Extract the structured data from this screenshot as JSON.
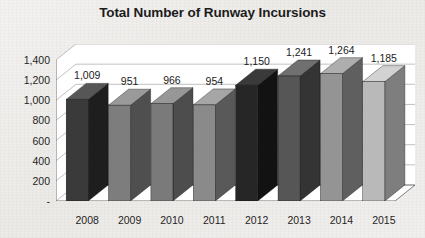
{
  "chart_data": {
    "type": "bar",
    "title": "Total Number of Runway Incursions",
    "xlabel": "",
    "ylabel": "",
    "categories": [
      "2008",
      "2009",
      "2010",
      "2011",
      "2012",
      "2013",
      "2014",
      "2015"
    ],
    "values": [
      1009,
      951,
      966,
      954,
      1150,
      1241,
      1264,
      1185
    ],
    "value_labels": [
      "1,009",
      "951",
      "966",
      "954",
      "1,150",
      "1,241",
      "1,264",
      "1,185"
    ],
    "ylim": [
      0,
      1400
    ],
    "ytick_values": [
      1400,
      1200,
      1000,
      800,
      600,
      400,
      200,
      0
    ],
    "ytick_labels": [
      "1,400",
      "1,200",
      "1,000",
      "800",
      "600",
      "400",
      "200",
      "-"
    ],
    "grid": true,
    "legend": "none",
    "style": "3d-perspective-column",
    "bar_colors": [
      "#3a3a3a",
      "#7d7d7d",
      "#7a7a7a",
      "#8a8a8a",
      "#262626",
      "#565656",
      "#949494",
      "#b9b9b9"
    ],
    "bar_side_colors": [
      "#1e1e1e",
      "#4f4f4f",
      "#4d4d4d",
      "#595959",
      "#121212",
      "#343434",
      "#5f5f5f",
      "#7e7e7e"
    ],
    "bar_top_colors": [
      "#565656",
      "#9a9a9a",
      "#979797",
      "#a6a6a6",
      "#3a3a3a",
      "#707070",
      "#aeaeae",
      "#d2d2d2"
    ],
    "plot_background": "#ffffff",
    "gridline_color": "#b0b0b0",
    "axis_color": "#6e6e6e",
    "text_color": "#1c1c1c",
    "page_background": "#efeeec"
  }
}
